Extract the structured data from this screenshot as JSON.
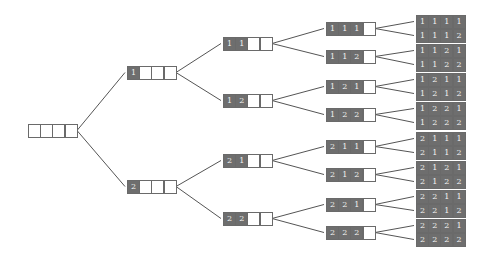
{
  "diagram": {
    "type": "tree",
    "colors": {
      "filled_cell": "#6e6e6e",
      "empty_cell": "#ffffff",
      "border": "#6a6a6a",
      "edge": "#555555",
      "digit": "#f2f2f2"
    },
    "nodes": [
      {
        "id": "root",
        "digits": [
          "",
          "",
          "",
          ""
        ],
        "x": 28,
        "y": 124
      },
      {
        "id": "n1",
        "digits": [
          "1",
          "",
          "",
          ""
        ],
        "x": 127,
        "y": 66
      },
      {
        "id": "n2",
        "digits": [
          "2",
          "",
          "",
          ""
        ],
        "x": 127,
        "y": 180
      },
      {
        "id": "n11",
        "digits": [
          "1",
          "1",
          "",
          ""
        ],
        "x": 223,
        "y": 37
      },
      {
        "id": "n12",
        "digits": [
          "1",
          "2",
          "",
          ""
        ],
        "x": 223,
        "y": 94
      },
      {
        "id": "n21",
        "digits": [
          "2",
          "1",
          "",
          ""
        ],
        "x": 223,
        "y": 154
      },
      {
        "id": "n22",
        "digits": [
          "2",
          "2",
          "",
          ""
        ],
        "x": 223,
        "y": 212
      },
      {
        "id": "n111",
        "digits": [
          "1",
          "1",
          "1",
          ""
        ],
        "x": 326,
        "y": 22
      },
      {
        "id": "n112",
        "digits": [
          "1",
          "1",
          "2",
          ""
        ],
        "x": 326,
        "y": 50
      },
      {
        "id": "n121",
        "digits": [
          "1",
          "2",
          "1",
          ""
        ],
        "x": 326,
        "y": 80
      },
      {
        "id": "n122",
        "digits": [
          "1",
          "2",
          "2",
          ""
        ],
        "x": 326,
        "y": 108
      },
      {
        "id": "n211",
        "digits": [
          "2",
          "1",
          "1",
          ""
        ],
        "x": 326,
        "y": 140
      },
      {
        "id": "n212",
        "digits": [
          "2",
          "1",
          "2",
          ""
        ],
        "x": 326,
        "y": 168
      },
      {
        "id": "n221",
        "digits": [
          "2",
          "2",
          "1",
          ""
        ],
        "x": 326,
        "y": 198
      },
      {
        "id": "n222",
        "digits": [
          "2",
          "2",
          "2",
          ""
        ],
        "x": 326,
        "y": 226
      },
      {
        "id": "n1111",
        "digits": [
          "1",
          "1",
          "1",
          "1"
        ],
        "x": 416,
        "y": 15
      },
      {
        "id": "n1112",
        "digits": [
          "1",
          "1",
          "1",
          "2"
        ],
        "x": 416,
        "y": 29
      },
      {
        "id": "n1121",
        "digits": [
          "1",
          "1",
          "2",
          "1"
        ],
        "x": 416,
        "y": 44
      },
      {
        "id": "n1122",
        "digits": [
          "1",
          "1",
          "2",
          "2"
        ],
        "x": 416,
        "y": 58
      },
      {
        "id": "n1211",
        "digits": [
          "1",
          "2",
          "1",
          "1"
        ],
        "x": 416,
        "y": 73
      },
      {
        "id": "n1212",
        "digits": [
          "1",
          "2",
          "1",
          "2"
        ],
        "x": 416,
        "y": 87
      },
      {
        "id": "n1221",
        "digits": [
          "1",
          "2",
          "2",
          "1"
        ],
        "x": 416,
        "y": 102
      },
      {
        "id": "n1222",
        "digits": [
          "1",
          "2",
          "2",
          "2"
        ],
        "x": 416,
        "y": 116
      },
      {
        "id": "n2111",
        "digits": [
          "2",
          "1",
          "1",
          "1"
        ],
        "x": 416,
        "y": 132
      },
      {
        "id": "n2112",
        "digits": [
          "2",
          "1",
          "1",
          "2"
        ],
        "x": 416,
        "y": 146
      },
      {
        "id": "n2121",
        "digits": [
          "2",
          "1",
          "2",
          "1"
        ],
        "x": 416,
        "y": 161
      },
      {
        "id": "n2122",
        "digits": [
          "2",
          "1",
          "2",
          "2"
        ],
        "x": 416,
        "y": 175
      },
      {
        "id": "n2211",
        "digits": [
          "2",
          "2",
          "1",
          "1"
        ],
        "x": 416,
        "y": 190
      },
      {
        "id": "n2212",
        "digits": [
          "2",
          "2",
          "1",
          "2"
        ],
        "x": 416,
        "y": 204
      },
      {
        "id": "n2221",
        "digits": [
          "2",
          "2",
          "2",
          "1"
        ],
        "x": 416,
        "y": 219
      },
      {
        "id": "n2222",
        "digits": [
          "2",
          "2",
          "2",
          "2"
        ],
        "x": 416,
        "y": 233
      }
    ],
    "edges": [
      [
        "root",
        "n1"
      ],
      [
        "root",
        "n2"
      ],
      [
        "n1",
        "n11"
      ],
      [
        "n1",
        "n12"
      ],
      [
        "n2",
        "n21"
      ],
      [
        "n2",
        "n22"
      ],
      [
        "n11",
        "n111"
      ],
      [
        "n11",
        "n112"
      ],
      [
        "n12",
        "n121"
      ],
      [
        "n12",
        "n122"
      ],
      [
        "n21",
        "n211"
      ],
      [
        "n21",
        "n212"
      ],
      [
        "n22",
        "n221"
      ],
      [
        "n22",
        "n222"
      ],
      [
        "n111",
        "n1111"
      ],
      [
        "n111",
        "n1112"
      ],
      [
        "n112",
        "n1121"
      ],
      [
        "n112",
        "n1122"
      ],
      [
        "n121",
        "n1211"
      ],
      [
        "n121",
        "n1212"
      ],
      [
        "n122",
        "n1221"
      ],
      [
        "n122",
        "n1222"
      ],
      [
        "n211",
        "n2111"
      ],
      [
        "n211",
        "n2112"
      ],
      [
        "n212",
        "n2121"
      ],
      [
        "n212",
        "n2122"
      ],
      [
        "n221",
        "n2211"
      ],
      [
        "n221",
        "n2212"
      ],
      [
        "n222",
        "n2221"
      ],
      [
        "n222",
        "n2222"
      ]
    ]
  }
}
